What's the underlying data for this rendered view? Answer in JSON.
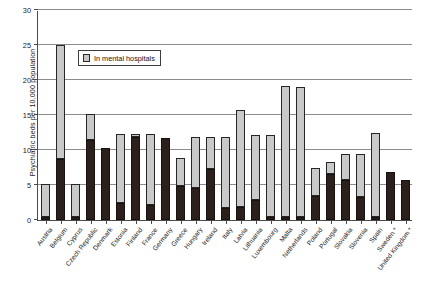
{
  "chart_data": {
    "type": "bar",
    "title": "",
    "subtitle": "",
    "xlabel": "",
    "ylabel": "Psychiatric beds per 10,000 population",
    "ylim": [
      0,
      30
    ],
    "yticks": [
      0,
      5,
      10,
      15,
      20,
      25,
      30
    ],
    "ytick_labels": [
      "0",
      "5",
      "10",
      "15",
      "20",
      "25",
      "30"
    ],
    "grid": true,
    "stacked": true,
    "legend_position": "inside-top-left",
    "legend": [
      {
        "label": "In mental hospitals",
        "color": "#c9c9c9"
      }
    ],
    "annotations": [
      "* Sweden and United Kingdom marked with asterisk"
    ],
    "categories": [
      "Austria",
      "Belgium",
      "Cyprus",
      "Czech Republic",
      "Denmark",
      "Estonia",
      "Finland",
      "France",
      "Germany",
      "Greece",
      "Hungary",
      "Ireland",
      "Italy",
      "Latvia",
      "Lithuania",
      "Luxembourg",
      "Malta",
      "Netherlands",
      "Poland",
      "Portugal",
      "Slovakia",
      "Slovenia",
      "Spain",
      "Sweden *",
      "United Kingdom *"
    ],
    "series": [
      {
        "name": "Other psychiatric beds",
        "color": "#2b201b",
        "values": [
          0.5,
          8.7,
          0.4,
          11.5,
          10.3,
          2.4,
          11.8,
          2.2,
          11.7,
          4.9,
          4.6,
          7.3,
          1.7,
          1.8,
          2.9,
          0.4,
          0.5,
          0.4,
          3.4,
          6.6,
          5.7,
          3.3,
          0.4,
          6.8,
          5.7
        ]
      },
      {
        "name": "In mental hospitals",
        "color": "#c9c9c9",
        "values": [
          4.7,
          16.3,
          4.8,
          3.7,
          0.0,
          9.9,
          0.5,
          10.1,
          0.0,
          3.9,
          7.2,
          4.5,
          10.1,
          13.9,
          9.3,
          11.7,
          18.6,
          18.6,
          4.1,
          1.7,
          3.7,
          6.1,
          12.0,
          0.0,
          0.0
        ]
      }
    ],
    "totals": [
      5.2,
      25.0,
      5.2,
      15.2,
      10.3,
      12.3,
      12.3,
      12.3,
      11.7,
      8.8,
      11.8,
      11.8,
      11.8,
      15.7,
      12.2,
      12.1,
      19.1,
      19.0,
      7.5,
      8.3,
      9.4,
      9.4,
      12.4,
      6.8,
      5.7
    ]
  }
}
